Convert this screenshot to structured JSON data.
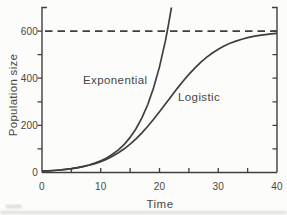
{
  "chart_data": {
    "type": "line",
    "title": "",
    "xlabel": "Time",
    "ylabel": "Population size",
    "xlim": [
      0,
      40
    ],
    "ylim": [
      0,
      700
    ],
    "x_ticks": [
      0,
      5,
      10,
      15,
      20,
      25,
      30,
      35,
      40
    ],
    "x_tick_labels": [
      0,
      10,
      20,
      30,
      40
    ],
    "y_tick_interval": 100,
    "y_tick_labels": [
      0,
      200,
      400,
      600
    ],
    "grid": false,
    "legend_position": "inline-annotations",
    "carrying_capacity": {
      "value": 600,
      "style": "dashed"
    },
    "colors": {
      "line": "#3f3f3f",
      "text": "#474747",
      "background": "#fcfcfa"
    },
    "series": [
      {
        "id": "exponential",
        "name": "Exponential",
        "points": [
          [
            0,
            5.5
          ],
          [
            1,
            6.9
          ],
          [
            2,
            8.5
          ],
          [
            3,
            10.6
          ],
          [
            4,
            13.3
          ],
          [
            5,
            16.5
          ],
          [
            6,
            20.6
          ],
          [
            7,
            25.7
          ],
          [
            8,
            32.0
          ],
          [
            9,
            39.8
          ],
          [
            10,
            49.6
          ],
          [
            11,
            61.9
          ],
          [
            12,
            77.1
          ],
          [
            13,
            96.0
          ],
          [
            14,
            119.7
          ],
          [
            15,
            149.1
          ],
          [
            16,
            185.8
          ],
          [
            17,
            231.5
          ],
          [
            18,
            288.5
          ],
          [
            19,
            359.5
          ],
          [
            20,
            448.0
          ],
          [
            21,
            558.2
          ],
          [
            21.5,
            623.2
          ],
          [
            22,
            695.6
          ],
          [
            22.03,
            700
          ]
        ]
      },
      {
        "id": "logistic",
        "name": "Logistic",
        "points": [
          [
            0,
            5.5
          ],
          [
            1,
            6.8
          ],
          [
            2,
            8.5
          ],
          [
            3,
            10.6
          ],
          [
            4,
            13.1
          ],
          [
            5,
            16.2
          ],
          [
            6,
            20.1
          ],
          [
            7,
            24.8
          ],
          [
            8,
            30.6
          ],
          [
            9,
            37.7
          ],
          [
            10,
            46.2
          ],
          [
            11,
            56.6
          ],
          [
            12,
            68.9
          ],
          [
            13,
            83.4
          ],
          [
            14,
            100.5
          ],
          [
            15,
            120.3
          ],
          [
            16,
            142.8
          ],
          [
            17,
            168.1
          ],
          [
            18,
            196.0
          ],
          [
            19,
            225.9
          ],
          [
            20,
            257.8
          ],
          [
            21,
            290.5
          ],
          [
            22,
            323.5
          ],
          [
            23,
            355.8
          ],
          [
            24,
            386.9
          ],
          [
            25,
            416.1
          ],
          [
            26,
            442.9
          ],
          [
            27,
            467.0
          ],
          [
            28,
            488.4
          ],
          [
            29,
            507.0
          ],
          [
            30,
            523.0
          ],
          [
            31,
            536.6
          ],
          [
            32,
            548.0
          ],
          [
            33,
            557.6
          ],
          [
            34,
            565.4
          ],
          [
            35,
            572.0
          ],
          [
            36,
            577.3
          ],
          [
            37,
            581.6
          ],
          [
            38,
            585.1
          ],
          [
            39,
            588.0
          ],
          [
            40,
            590.4
          ]
        ]
      }
    ]
  }
}
